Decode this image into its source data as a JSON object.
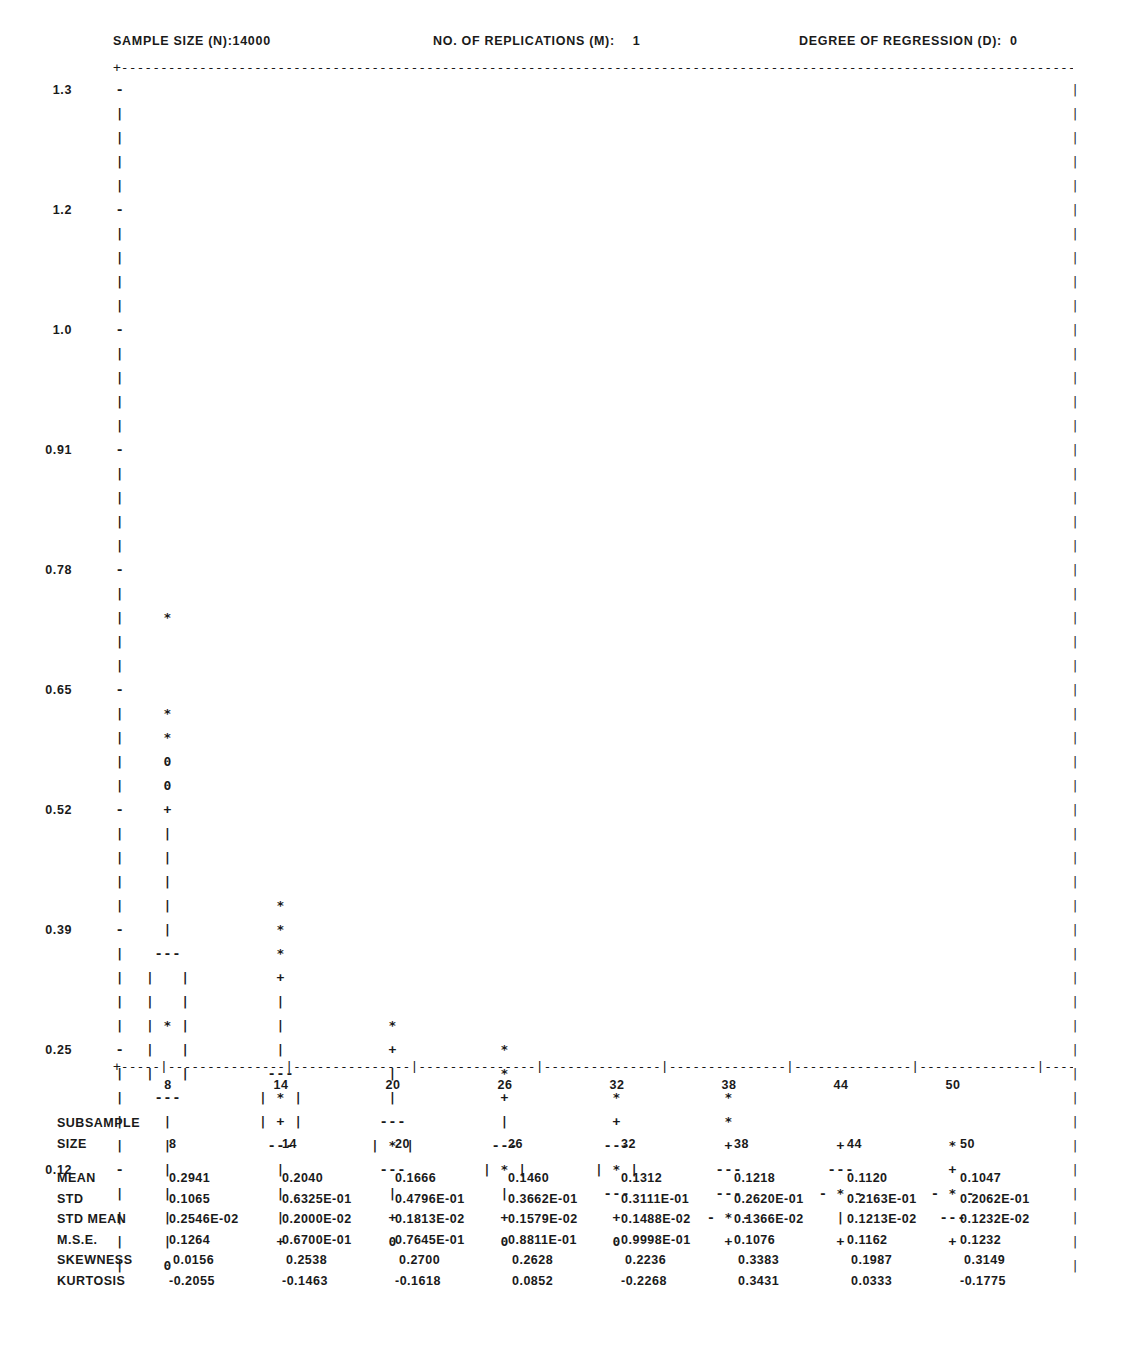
{
  "header": {
    "sample_size_label": "SAMPLE SIZE (N):",
    "sample_size_value": "14000",
    "replications_label": "NO. OF REPLICATIONS (M):",
    "replications_value": "1",
    "degree_label": "DEGREE OF REGRESSION (D):",
    "degree_value": "0"
  },
  "frame": {
    "top_rule": "+----------------------------------------------------------------------------------------------------------------------------+",
    "bottom_rule": "+-----|---------------|---------------|---------------|---------------|---------------|---------------|---------------|---------------+",
    "corner_char": "+",
    "edge_char": "|"
  },
  "chart_data": {
    "type": "box",
    "xlabel": "SUBSAMPLE SIZE",
    "ylabel": "",
    "ylim": [
      0.0,
      1.36
    ],
    "grid": false,
    "legend": "none",
    "y_ticks": [
      "1.3",
      "1.2",
      "1.0",
      "0.91",
      "0.78",
      "0.65",
      "0.52",
      "0.39",
      "0.25",
      "0.12"
    ],
    "y_tick_values": [
      1.3,
      1.2,
      1.0,
      0.91,
      0.78,
      0.65,
      0.52,
      0.39,
      0.25,
      0.12
    ],
    "x_ticks": [
      "8",
      "14",
      "20",
      "26",
      "32",
      "38",
      "44",
      "50"
    ],
    "x_tick_values": [
      8,
      14,
      20,
      26,
      32,
      38,
      44,
      50
    ],
    "glyphs": {
      "outlier_far": "*",
      "outlier_near": "+",
      "extreme": "0",
      "whisker": "|",
      "box_edge": "---",
      "box_side": "|   |",
      "median_in_box": "|*|",
      "median_flat": "-*-"
    },
    "series": [
      {
        "name": "8",
        "median": 0.2941,
        "std": 0.1065
      },
      {
        "name": "14",
        "median": 0.204,
        "std": 0.06325
      },
      {
        "name": "20",
        "median": 0.1666,
        "std": 0.04796
      },
      {
        "name": "26",
        "median": 0.146,
        "std": 0.03662
      },
      {
        "name": "32",
        "median": 0.1312,
        "std": 0.03111
      },
      {
        "name": "38",
        "median": 0.1218,
        "std": 0.0262
      },
      {
        "name": "44",
        "median": 0.112,
        "std": 0.02163
      },
      {
        "name": "50",
        "median": 0.1047,
        "std": 0.02062
      }
    ],
    "columns_x": [
      168,
      281,
      393,
      505,
      617,
      729,
      841,
      953
    ],
    "rows": [
      {
        "y": 1.3,
        "label": "1.3",
        "tick": "-",
        "cells": [
          "",
          "",
          "",
          "",
          "",
          "",
          "",
          ""
        ]
      },
      {
        "y": null,
        "label": "",
        "tick": "|",
        "cells": [
          "",
          "",
          "",
          "",
          "",
          "",
          "",
          ""
        ]
      },
      {
        "y": null,
        "label": "",
        "tick": "|",
        "cells": [
          "",
          "",
          "",
          "",
          "",
          "",
          "",
          ""
        ]
      },
      {
        "y": null,
        "label": "",
        "tick": "|",
        "cells": [
          "",
          "",
          "",
          "",
          "",
          "",
          "",
          ""
        ]
      },
      {
        "y": null,
        "label": "",
        "tick": "|",
        "cells": [
          "",
          "",
          "",
          "",
          "",
          "",
          "",
          ""
        ]
      },
      {
        "y": 1.2,
        "label": "1.2",
        "tick": "-",
        "cells": [
          "",
          "",
          "",
          "",
          "",
          "",
          "",
          ""
        ]
      },
      {
        "y": null,
        "label": "",
        "tick": "|",
        "cells": [
          "",
          "",
          "",
          "",
          "",
          "",
          "",
          ""
        ]
      },
      {
        "y": null,
        "label": "",
        "tick": "|",
        "cells": [
          "",
          "",
          "",
          "",
          "",
          "",
          "",
          ""
        ]
      },
      {
        "y": null,
        "label": "",
        "tick": "|",
        "cells": [
          "",
          "",
          "",
          "",
          "",
          "",
          "",
          ""
        ]
      },
      {
        "y": null,
        "label": "",
        "tick": "|",
        "cells": [
          "",
          "",
          "",
          "",
          "",
          "",
          "",
          ""
        ]
      },
      {
        "y": 1.0,
        "label": "1.0",
        "tick": "-",
        "cells": [
          "",
          "",
          "",
          "",
          "",
          "",
          "",
          ""
        ]
      },
      {
        "y": null,
        "label": "",
        "tick": "|",
        "cells": [
          "",
          "",
          "",
          "",
          "",
          "",
          "",
          ""
        ]
      },
      {
        "y": null,
        "label": "",
        "tick": "|",
        "cells": [
          "",
          "",
          "",
          "",
          "",
          "",
          "",
          ""
        ]
      },
      {
        "y": null,
        "label": "",
        "tick": "|",
        "cells": [
          "",
          "",
          "",
          "",
          "",
          "",
          "",
          ""
        ]
      },
      {
        "y": null,
        "label": "",
        "tick": "|",
        "cells": [
          "",
          "",
          "",
          "",
          "",
          "",
          "",
          ""
        ]
      },
      {
        "y": 0.91,
        "label": "0.91",
        "tick": "-",
        "cells": [
          "",
          "",
          "",
          "",
          "",
          "",
          "",
          ""
        ]
      },
      {
        "y": null,
        "label": "",
        "tick": "|",
        "cells": [
          "",
          "",
          "",
          "",
          "",
          "",
          "",
          ""
        ]
      },
      {
        "y": null,
        "label": "",
        "tick": "|",
        "cells": [
          "",
          "",
          "",
          "",
          "",
          "",
          "",
          ""
        ]
      },
      {
        "y": null,
        "label": "",
        "tick": "|",
        "cells": [
          "",
          "",
          "",
          "",
          "",
          "",
          "",
          ""
        ]
      },
      {
        "y": null,
        "label": "",
        "tick": "|",
        "cells": [
          "",
          "",
          "",
          "",
          "",
          "",
          "",
          ""
        ]
      },
      {
        "y": 0.78,
        "label": "0.78",
        "tick": "-",
        "cells": [
          "",
          "",
          "",
          "",
          "",
          "",
          "",
          ""
        ]
      },
      {
        "y": null,
        "label": "",
        "tick": "|",
        "cells": [
          "",
          "",
          "",
          "",
          "",
          "",
          "",
          ""
        ]
      },
      {
        "y": null,
        "label": "",
        "tick": "|",
        "cells": [
          "*",
          "",
          "",
          "",
          "",
          "",
          "",
          ""
        ]
      },
      {
        "y": null,
        "label": "",
        "tick": "|",
        "cells": [
          "",
          "",
          "",
          "",
          "",
          "",
          "",
          ""
        ]
      },
      {
        "y": null,
        "label": "",
        "tick": "|",
        "cells": [
          "",
          "",
          "",
          "",
          "",
          "",
          "",
          ""
        ]
      },
      {
        "y": 0.65,
        "label": "0.65",
        "tick": "-",
        "cells": [
          "",
          "",
          "",
          "",
          "",
          "",
          "",
          ""
        ]
      },
      {
        "y": null,
        "label": "",
        "tick": "|",
        "cells": [
          "*",
          "",
          "",
          "",
          "",
          "",
          "",
          ""
        ]
      },
      {
        "y": null,
        "label": "",
        "tick": "|",
        "cells": [
          "*",
          "",
          "",
          "",
          "",
          "",
          "",
          ""
        ]
      },
      {
        "y": null,
        "label": "",
        "tick": "|",
        "cells": [
          "0",
          "",
          "",
          "",
          "",
          "",
          "",
          ""
        ]
      },
      {
        "y": null,
        "label": "",
        "tick": "|",
        "cells": [
          "0",
          "",
          "",
          "",
          "",
          "",
          "",
          ""
        ]
      },
      {
        "y": 0.52,
        "label": "0.52",
        "tick": "-",
        "cells": [
          "+",
          "",
          "",
          "",
          "",
          "",
          "",
          ""
        ]
      },
      {
        "y": null,
        "label": "",
        "tick": "|",
        "cells": [
          "|",
          "",
          "",
          "",
          "",
          "",
          "",
          ""
        ]
      },
      {
        "y": null,
        "label": "",
        "tick": "|",
        "cells": [
          "|",
          "",
          "",
          "",
          "",
          "",
          "",
          ""
        ]
      },
      {
        "y": null,
        "label": "",
        "tick": "|",
        "cells": [
          "|",
          "",
          "",
          "",
          "",
          "",
          "",
          ""
        ]
      },
      {
        "y": null,
        "label": "",
        "tick": "|",
        "cells": [
          "|",
          "*",
          "",
          "",
          "",
          "",
          "",
          ""
        ]
      },
      {
        "y": 0.39,
        "label": "0.39",
        "tick": "-",
        "cells": [
          "|",
          "*",
          "",
          "",
          "",
          "",
          "",
          ""
        ]
      },
      {
        "y": null,
        "label": "",
        "tick": "|",
        "cells": [
          "---",
          "*",
          "",
          "",
          "",
          "",
          "",
          ""
        ]
      },
      {
        "y": null,
        "label": "",
        "tick": "|",
        "cells": [
          "|   |",
          "+",
          "",
          "",
          "",
          "",
          "",
          ""
        ]
      },
      {
        "y": null,
        "label": "",
        "tick": "|",
        "cells": [
          "|   |",
          "|",
          "",
          "",
          "",
          "",
          "",
          ""
        ]
      },
      {
        "y": null,
        "label": "",
        "tick": "|",
        "cells": [
          "| * |",
          "|",
          "*",
          "",
          "",
          "",
          "",
          ""
        ]
      },
      {
        "y": 0.25,
        "label": "0.25",
        "tick": "-",
        "cells": [
          "|   |",
          "|",
          "+",
          "*",
          "",
          "",
          "",
          ""
        ]
      },
      {
        "y": null,
        "label": "",
        "tick": "|",
        "cells": [
          "|   |",
          "---",
          "|",
          "*",
          "",
          "",
          "",
          ""
        ]
      },
      {
        "y": null,
        "label": "",
        "tick": "|",
        "cells": [
          "---",
          "| * |",
          "|",
          "+",
          "*",
          "*",
          "",
          ""
        ]
      },
      {
        "y": null,
        "label": "",
        "tick": "|",
        "cells": [
          "|",
          "| + |",
          "---",
          "|",
          "+",
          "*",
          "",
          ""
        ]
      },
      {
        "y": null,
        "label": "",
        "tick": "|",
        "cells": [
          "|",
          "---",
          "| * |",
          "---",
          "---",
          "+",
          "+",
          "*"
        ]
      },
      {
        "y": 0.12,
        "label": "0.12",
        "tick": "-",
        "cells": [
          "|",
          "|",
          "---",
          "| * |",
          "| * |",
          "---",
          "---",
          "+"
        ]
      },
      {
        "y": null,
        "label": "",
        "tick": "|",
        "cells": [
          "|",
          "|",
          "|",
          "|",
          "---",
          "---",
          "- * -",
          "- * -"
        ]
      },
      {
        "y": null,
        "label": "",
        "tick": "|",
        "cells": [
          "|",
          "|",
          "+",
          "+",
          "+",
          "- * -",
          "|",
          "---"
        ]
      },
      {
        "y": null,
        "label": "",
        "tick": "|",
        "cells": [
          "|",
          "+",
          "0",
          "0",
          "0",
          "+",
          "+",
          "+"
        ]
      },
      {
        "y": null,
        "label": "",
        "tick": "|",
        "cells": [
          "0",
          "",
          "",
          "",
          "",
          "",
          "",
          ""
        ]
      }
    ]
  },
  "stats_table": {
    "title_line1": "SUBSAMPLE",
    "title_line2": "SIZE",
    "columns": [
      "8",
      "14",
      "20",
      "26",
      "32",
      "38",
      "44",
      "50"
    ],
    "rows": [
      {
        "label": "MEAN",
        "values": [
          "0.2941",
          "0.2040",
          "0.1666",
          "0.1460",
          "0.1312",
          "0.1218",
          "0.1120",
          "0.1047"
        ]
      },
      {
        "label": "STD",
        "values": [
          "0.1065",
          "0.6325E-01",
          "0.4796E-01",
          "0.3662E-01",
          "0.3111E-01",
          "0.2620E-01",
          "0.2163E-01",
          "0.2062E-01"
        ]
      },
      {
        "label": "STD MEAN",
        "values": [
          "0.2546E-02",
          "0.2000E-02",
          "0.1813E-02",
          "0.1579E-02",
          "0.1488E-02",
          "0.1366E-02",
          "0.1213E-02",
          "0.1232E-02"
        ]
      },
      {
        "label": "M.S.E.",
        "values": [
          "0.1264",
          "0.6700E-01",
          "0.7645E-01",
          "0.8811E-01",
          "0.9998E-01",
          "0.1076",
          "0.1162",
          "0.1232"
        ]
      },
      {
        "label": "SKEWNESS",
        "values": [
          " 0.0156",
          " 0.2538",
          " 0.2700",
          " 0.2628",
          " 0.2236",
          " 0.3383",
          " 0.1987",
          " 0.3149"
        ]
      },
      {
        "label": "KURTOSIS",
        "values": [
          "-0.2055",
          "-0.1463",
          "-0.1618",
          " 0.0852",
          "-0.2268",
          " 0.3431",
          " 0.0333",
          "-0.1775"
        ]
      }
    ]
  }
}
